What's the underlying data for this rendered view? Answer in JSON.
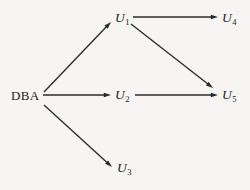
{
  "diagram": {
    "background_color": "#f6f5f3",
    "stroke_color": "#2b2b2b",
    "text_color": "#232323",
    "nodes": [
      {
        "id": "DBA",
        "label": "DBA",
        "base": "DBA",
        "subscript": "",
        "style": "plain",
        "x": 11,
        "y": 89
      },
      {
        "id": "U1",
        "label": "U1",
        "base": "U",
        "subscript": "1",
        "style": "varname",
        "x": 115,
        "y": 11
      },
      {
        "id": "U2",
        "label": "U2",
        "base": "U",
        "subscript": "2",
        "style": "varname",
        "x": 115,
        "y": 88
      },
      {
        "id": "U3",
        "label": "U3",
        "base": "U",
        "subscript": "3",
        "style": "varname",
        "x": 117,
        "y": 161
      },
      {
        "id": "U4",
        "label": "U4",
        "base": "U",
        "subscript": "4",
        "style": "varname",
        "x": 222,
        "y": 11
      },
      {
        "id": "U5",
        "label": "U5",
        "base": "U",
        "subscript": "5",
        "style": "varname",
        "x": 222,
        "y": 88
      }
    ],
    "edges": [
      {
        "id": "dba-u1",
        "from": "DBA",
        "to": "U1",
        "x1": 44,
        "y1": 92,
        "x2": 111,
        "y2": 22
      },
      {
        "id": "dba-u2",
        "from": "DBA",
        "to": "U2",
        "x1": 43,
        "y1": 95,
        "x2": 111,
        "y2": 95
      },
      {
        "id": "dba-u3",
        "from": "DBA",
        "to": "U3",
        "x1": 44,
        "y1": 105,
        "x2": 112,
        "y2": 167
      },
      {
        "id": "u1-u4",
        "from": "U1",
        "to": "U4",
        "x1": 133,
        "y1": 17,
        "x2": 218,
        "y2": 17
      },
      {
        "id": "u1-u5",
        "from": "U1",
        "to": "U5",
        "x1": 131,
        "y1": 24,
        "x2": 213,
        "y2": 88
      },
      {
        "id": "u2-u5",
        "from": "U2",
        "to": "U5",
        "x1": 135,
        "y1": 95,
        "x2": 218,
        "y2": 95
      }
    ]
  }
}
